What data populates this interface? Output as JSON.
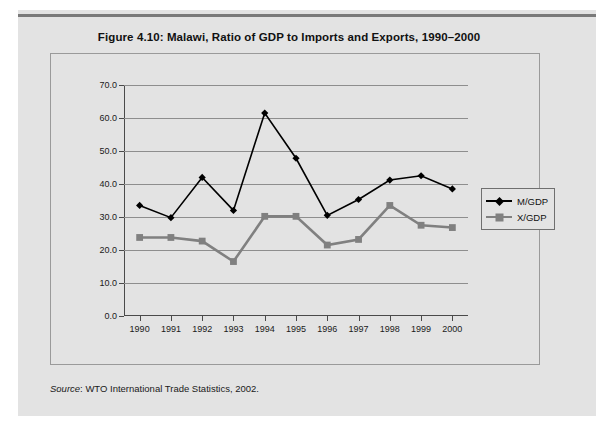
{
  "figure": {
    "title": "Figure 4.10:  Malawi, Ratio of GDP to Imports and Exports, 1990–2000",
    "source_label": "Source",
    "source_text": ": WTO International Trade Statistics, 2002."
  },
  "colors": {
    "page_background": "#ffffff",
    "panel_background": "#e3e3e3",
    "plot_background": "#e3e3e3",
    "gridline": "#8e8e8e",
    "axis": "#4a4a4a",
    "series_mgdp": "#000000",
    "series_xgdp": "#808080",
    "frame_border": "#9a9a9a",
    "top_rule": "#7a7a7a"
  },
  "chart_data": {
    "type": "line",
    "title": "Figure 4.10:  Malawi, Ratio of GDP to Imports and Exports, 1990–2000",
    "xlabel": "",
    "ylabel": "",
    "categories": [
      "1990",
      "1991",
      "1992",
      "1993",
      "1994",
      "1995",
      "1996",
      "1997",
      "1998",
      "1999",
      "2000"
    ],
    "ylim": [
      0.0,
      70.0
    ],
    "ytick_labels": [
      "0.0",
      "10.0",
      "20.0",
      "30.0",
      "40.0",
      "50.0",
      "60.0",
      "70.0"
    ],
    "ytick_values": [
      0.0,
      10.0,
      20.0,
      30.0,
      40.0,
      50.0,
      60.0,
      70.0
    ],
    "grid": true,
    "legend_position": "right",
    "series": [
      {
        "name": "M/GDP",
        "marker": "diamond",
        "color": "#000000",
        "values": [
          33.5,
          29.8,
          42.0,
          32.0,
          61.5,
          47.8,
          30.5,
          35.3,
          41.2,
          42.5,
          38.5
        ]
      },
      {
        "name": "X/GDP",
        "marker": "square",
        "color": "#808080",
        "values": [
          23.8,
          23.8,
          22.7,
          16.5,
          30.2,
          30.2,
          21.5,
          23.2,
          33.5,
          27.5,
          26.8
        ]
      }
    ]
  }
}
